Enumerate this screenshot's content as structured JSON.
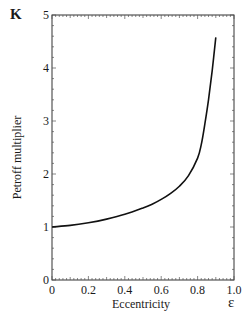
{
  "chart_data": {
    "type": "line",
    "title": "",
    "panel_label": "K",
    "xlabel": "Eccentricity",
    "xsymbol": "ε",
    "ylabel": "Petroff multiplier",
    "xlim": [
      0,
      1.0
    ],
    "ylim": [
      0,
      5
    ],
    "x_ticks": [
      "0",
      "0.2",
      "0.4",
      "0.6",
      "0.8",
      "1.0"
    ],
    "y_ticks": [
      "0",
      "1",
      "2",
      "3",
      "4",
      "5"
    ],
    "grid": false,
    "legend": null,
    "series": [
      {
        "name": "Petroff multiplier",
        "x": [
          0,
          0.1,
          0.2,
          0.3,
          0.4,
          0.5,
          0.55,
          0.6,
          0.65,
          0.7,
          0.75,
          0.8,
          0.82,
          0.84,
          0.86,
          0.88,
          0.9
        ],
        "y": [
          1.0,
          1.03,
          1.08,
          1.15,
          1.24,
          1.36,
          1.43,
          1.52,
          1.63,
          1.77,
          1.97,
          2.3,
          2.55,
          2.95,
          3.4,
          3.95,
          4.58
        ]
      }
    ]
  }
}
